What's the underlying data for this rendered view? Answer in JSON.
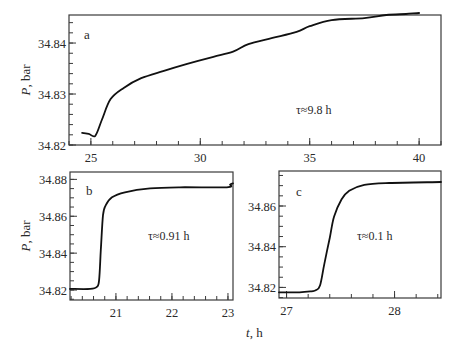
{
  "figure": {
    "x_axis_label": "t, h",
    "y_axis_label": "P, bar",
    "line_color": "#111111",
    "frame_color": "#3a3a3a"
  },
  "chart_data": [
    {
      "type": "line",
      "panel": "a",
      "annotation": "τ≈9.8 h",
      "xlabel": "t, h",
      "ylabel": "P, bar",
      "xlim": [
        24.0,
        41.0
      ],
      "ylim": [
        34.82,
        34.8455
      ],
      "xticks_major": [
        25,
        30,
        35,
        40
      ],
      "xticks_minor_step": 1,
      "yticks_major": [
        34.82,
        34.83,
        34.84
      ],
      "yticks_minor_step": 0.002,
      "grid": false,
      "x": [
        24.6,
        24.9,
        25.2,
        25.5,
        25.9,
        26.5,
        27.3,
        28.3,
        29.4,
        30.6,
        31.5,
        32.2,
        33.3,
        34.4,
        35.0,
        36.0,
        37.5,
        38.5,
        39.4,
        40.0
      ],
      "y": [
        34.8224,
        34.8222,
        34.8218,
        34.8249,
        34.829,
        34.8312,
        34.8331,
        34.8345,
        34.8359,
        34.8373,
        34.8383,
        34.8398,
        34.841,
        34.8422,
        34.8433,
        34.8445,
        34.8449,
        34.8455,
        34.8457,
        34.8459
      ]
    },
    {
      "type": "line",
      "panel": "b",
      "annotation": "τ≈0.91 h",
      "xlabel": "t, h",
      "ylabel": "P, bar",
      "xlim": [
        20.18,
        23.09
      ],
      "ylim": [
        34.8146,
        34.884
      ],
      "xticks_major": [
        21,
        22,
        23
      ],
      "xticks_minor_step": 0.2,
      "yticks_major": [
        34.82,
        34.84,
        34.86,
        34.88
      ],
      "yticks_minor_step": 0.005,
      "grid": false,
      "x": [
        20.18,
        20.54,
        20.66,
        20.7,
        20.73,
        20.77,
        20.82,
        20.93,
        21.16,
        21.61,
        22.14,
        22.98,
        23.04,
        23.09
      ],
      "y": [
        34.8206,
        34.8206,
        34.8217,
        34.8254,
        34.8417,
        34.8606,
        34.866,
        34.8703,
        34.873,
        34.8751,
        34.8757,
        34.8757,
        34.8773,
        34.8779
      ]
    },
    {
      "type": "line",
      "panel": "c",
      "annotation": "τ≈0.1 h",
      "xlabel": "t, h",
      "ylabel": "P, bar",
      "xlim": [
        26.93,
        28.43
      ],
      "ylim": [
        34.8148,
        34.8772
      ],
      "xticks_major": [
        27,
        28
      ],
      "xticks_minor_step": 0.2,
      "yticks_major": [
        34.82,
        34.84,
        34.86
      ],
      "yticks_minor_step": 0.005,
      "grid": false,
      "x": [
        26.93,
        27.12,
        27.23,
        27.27,
        27.31,
        27.35,
        27.4,
        27.44,
        27.51,
        27.58,
        27.72,
        27.95,
        28.43
      ],
      "y": [
        34.8176,
        34.8176,
        34.8181,
        34.8186,
        34.8209,
        34.8317,
        34.8444,
        34.8548,
        34.8633,
        34.8675,
        34.8704,
        34.8713,
        34.8718
      ]
    }
  ]
}
